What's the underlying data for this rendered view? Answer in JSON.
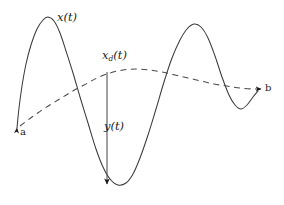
{
  "figure": {
    "title": "",
    "background_color": "#ffffff",
    "curve_color": "#3a3a3a",
    "dashed_color": "#4a4a4a",
    "arrow_color": "#1a1a1a",
    "labels": {
      "x_of_t": "x(t)",
      "xd_base": "x",
      "xd_sub": "d",
      "xd_tail": "(t)",
      "y_of_t": "y(t)",
      "point_a": "a",
      "point_b": "b"
    }
  },
  "chart_data": {
    "type": "line",
    "title": "",
    "xlabel": "",
    "ylabel": "",
    "grid": false,
    "legend": "none",
    "xlim": [
      0,
      284
    ],
    "ylim": [
      205,
      0
    ],
    "annotations": [
      {
        "name": "x(t)",
        "text": "x(t)",
        "x": 57,
        "y": 12,
        "refers_to": "solid-curve"
      },
      {
        "name": "x_d(t)",
        "text": "x_d(t)",
        "x": 102,
        "y": 50,
        "refers_to": "dashed-curve"
      },
      {
        "name": "y(t)",
        "text": "y(t)",
        "x": 104,
        "y": 121,
        "refers_to": "error-arrow"
      },
      {
        "name": "a",
        "text": "a",
        "x": 20,
        "y": 127,
        "refers_to": "start-point"
      },
      {
        "name": "b",
        "text": "b",
        "x": 265,
        "y": 83,
        "refers_to": "end-point"
      }
    ],
    "series": [
      {
        "name": "x(t)",
        "style": "solid",
        "color": "#3a3a3a",
        "arrow_start": true,
        "arrow_end": false,
        "points": [
          [
            17,
            128
          ],
          [
            19,
            108
          ],
          [
            22,
            86
          ],
          [
            26,
            64
          ],
          [
            31,
            45
          ],
          [
            37,
            29
          ],
          [
            43,
            20
          ],
          [
            48,
            17
          ],
          [
            54,
            21
          ],
          [
            60,
            33
          ],
          [
            66,
            51
          ],
          [
            73,
            73
          ],
          [
            80,
            97
          ],
          [
            88,
            123
          ],
          [
            96,
            149
          ],
          [
            103,
            167
          ],
          [
            110,
            179
          ],
          [
            118,
            185
          ],
          [
            126,
            183
          ],
          [
            133,
            174
          ],
          [
            140,
            158
          ],
          [
            148,
            135
          ],
          [
            156,
            109
          ],
          [
            164,
            82
          ],
          [
            172,
            58
          ],
          [
            180,
            40
          ],
          [
            187,
            29
          ],
          [
            194,
            24
          ],
          [
            201,
            27
          ],
          [
            208,
            38
          ],
          [
            215,
            56
          ],
          [
            222,
            77
          ],
          [
            229,
            95
          ],
          [
            235,
            105
          ],
          [
            241,
            109
          ],
          [
            247,
            105
          ],
          [
            253,
            97
          ],
          [
            258,
            91
          ]
        ]
      },
      {
        "name": "x_d(t)",
        "style": "dashed",
        "color": "#4a4a4a",
        "arrow_start": false,
        "arrow_end": true,
        "points": [
          [
            20,
            126
          ],
          [
            32,
            117
          ],
          [
            45,
            108
          ],
          [
            58,
            100
          ],
          [
            71,
            92
          ],
          [
            84,
            85
          ],
          [
            97,
            78
          ],
          [
            110,
            73
          ],
          [
            123,
            70
          ],
          [
            136,
            69
          ],
          [
            149,
            70
          ],
          [
            162,
            72
          ],
          [
            175,
            75
          ],
          [
            188,
            78
          ],
          [
            201,
            81
          ],
          [
            214,
            84
          ],
          [
            227,
            86
          ],
          [
            240,
            88
          ],
          [
            253,
            89
          ],
          [
            261,
            89
          ]
        ]
      }
    ],
    "error_arrow": {
      "name": "y(t)",
      "x": 107,
      "y_from": 72,
      "y_to": 184,
      "arrow_end": true,
      "color": "#4a4a4a"
    }
  }
}
